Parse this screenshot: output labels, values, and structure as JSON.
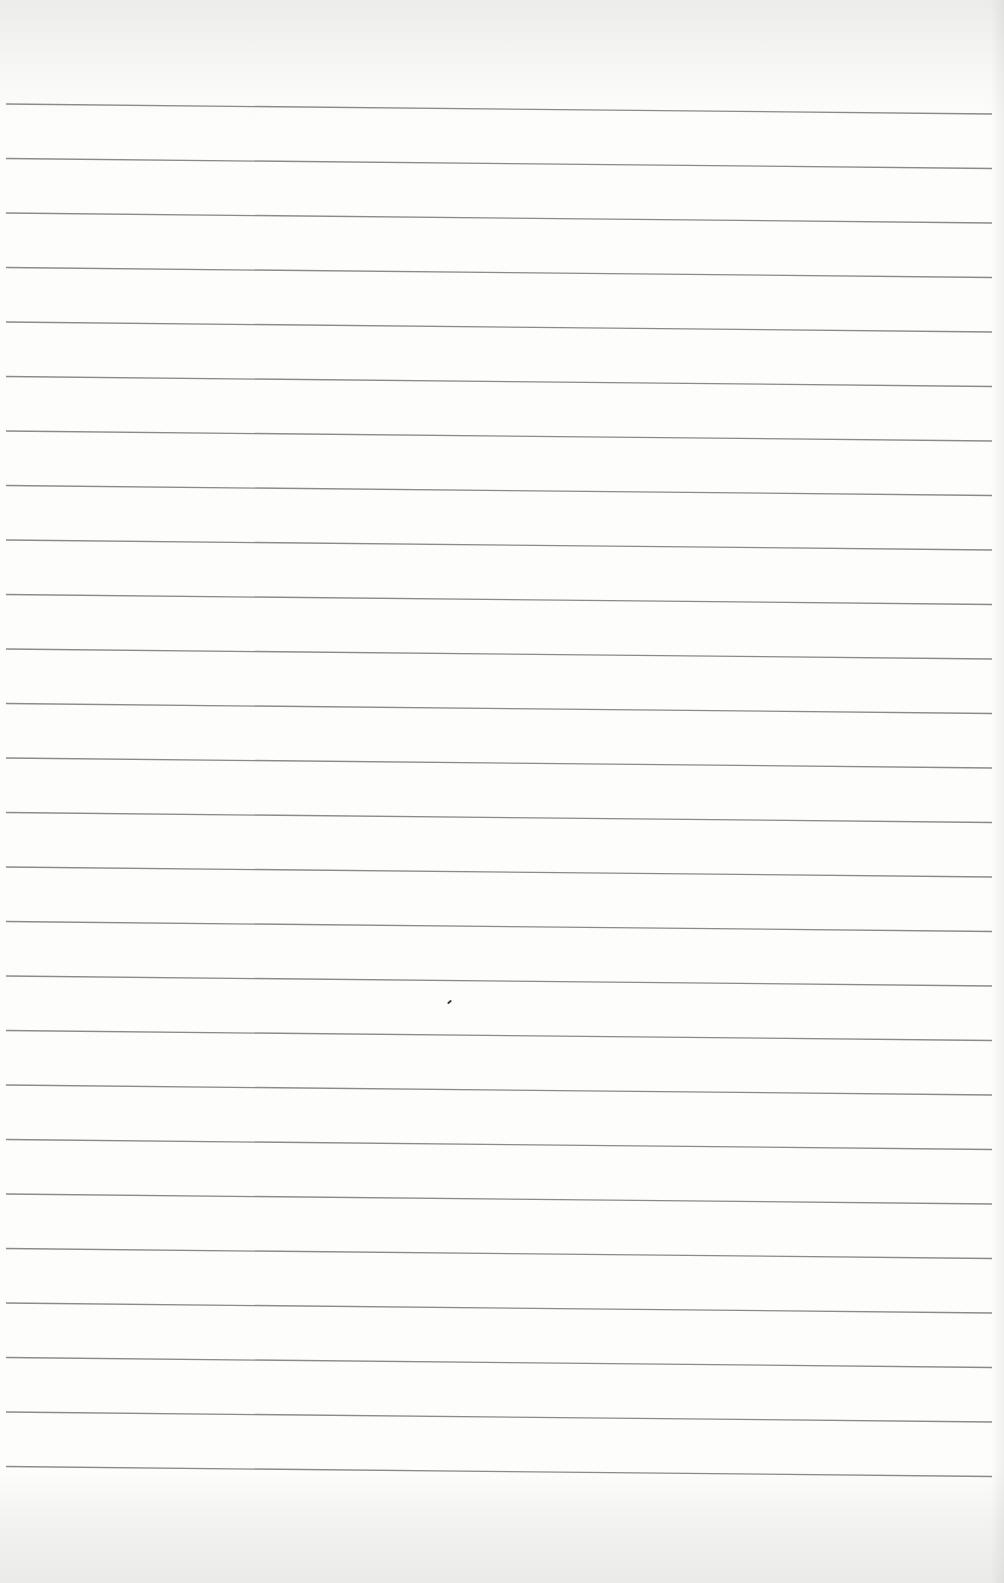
{
  "page": {
    "type": "blank lined notebook paper",
    "paper_color": "#fdfdfc",
    "rule_color": "#8a8a8a",
    "rule_count": 26,
    "first_rule_y_left": 104,
    "first_rule_y_right": 114,
    "rule_spacing": 54.5,
    "rule_x_start": 6,
    "rule_x_end": 992
  },
  "marks": [
    {
      "x": 447,
      "y": 1001
    }
  ]
}
